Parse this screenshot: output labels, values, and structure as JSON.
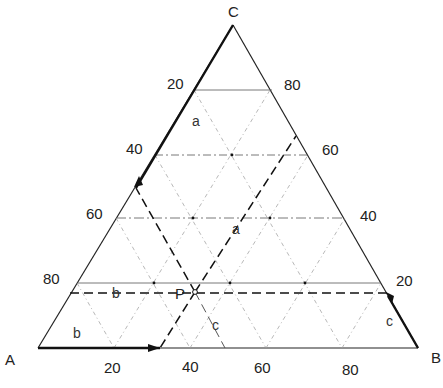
{
  "diagram": {
    "type": "ternary-diagram",
    "vertices": {
      "A": "A",
      "B": "B",
      "C": "C"
    },
    "point_label": "P",
    "left_axis_ticks": [
      "20",
      "40",
      "60",
      "80"
    ],
    "right_axis_ticks": [
      "80",
      "60",
      "40",
      "20"
    ],
    "bottom_axis_ticks": [
      "20",
      "40",
      "60",
      "80"
    ],
    "region_labels": {
      "a_top": "a",
      "a_mid": "a",
      "b_mid": "b",
      "b_low": "b",
      "c_mid": "c",
      "c_right": "c"
    },
    "point_P_composition": {
      "A": 40,
      "B": 45,
      "C": 15
    }
  }
}
